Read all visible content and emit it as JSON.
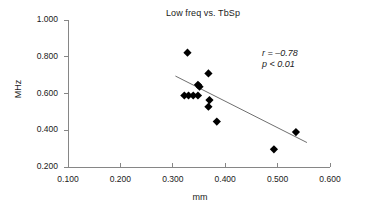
{
  "chart_data": {
    "type": "scatter",
    "title": "Low freq vs. TbSp",
    "xlabel": "mm",
    "ylabel": "MHz",
    "xlim": [
      0.1,
      0.6
    ],
    "ylim": [
      0.2,
      1.0
    ],
    "xticks": [
      "0.100",
      "0.200",
      "0.300",
      "0.400",
      "0.500",
      "0.600"
    ],
    "yticks": [
      "0.200",
      "0.400",
      "0.600",
      "0.800",
      "1.000"
    ],
    "xtick_values": [
      0.1,
      0.2,
      0.3,
      0.4,
      0.5,
      0.6
    ],
    "ytick_values": [
      0.2,
      0.4,
      0.6,
      0.8,
      1.0
    ],
    "grid": false,
    "legend": null,
    "marker": "diamond",
    "marker_color": "#000000",
    "points": [
      {
        "x": 0.328,
        "y": 0.822
      },
      {
        "x": 0.368,
        "y": 0.709
      },
      {
        "x": 0.348,
        "y": 0.647
      },
      {
        "x": 0.351,
        "y": 0.637
      },
      {
        "x": 0.322,
        "y": 0.589
      },
      {
        "x": 0.33,
        "y": 0.589
      },
      {
        "x": 0.339,
        "y": 0.589
      },
      {
        "x": 0.348,
        "y": 0.589
      },
      {
        "x": 0.37,
        "y": 0.564
      },
      {
        "x": 0.368,
        "y": 0.528
      },
      {
        "x": 0.384,
        "y": 0.447
      },
      {
        "x": 0.535,
        "y": 0.39
      },
      {
        "x": 0.493,
        "y": 0.296
      }
    ],
    "trend_line": {
      "x_start": 0.305,
      "y_start": 0.695,
      "x_end": 0.556,
      "y_end": 0.333,
      "color": "#6f6f6f"
    },
    "annotations": {
      "correlation": "r = –0.78",
      "pvalue": "p < 0.01"
    }
  }
}
